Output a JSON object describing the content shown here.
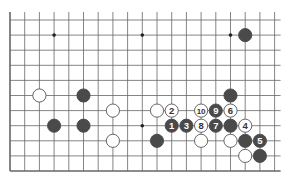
{
  "diagram": {
    "grid": {
      "origin_x": 10,
      "origin_y": 20,
      "spacing_x": 14.7,
      "spacing_y": 15.1,
      "cols": 19,
      "rows": 11,
      "left_edge": true,
      "bottom_edge": true,
      "top_edge": false,
      "right_edge": false
    },
    "colors": {
      "line": "#666666",
      "black": "#4a4a4a",
      "white": "#ffffff",
      "label_on_black": "#ffffff",
      "label_on_white": "#333333"
    },
    "star_points": [
      [
        3,
        1
      ],
      [
        9,
        1
      ],
      [
        15,
        1
      ],
      [
        9,
        7
      ]
    ],
    "stones": [
      {
        "col": 16,
        "row": 1,
        "color": "black",
        "label": ""
      },
      {
        "col": 2,
        "row": 5,
        "color": "white",
        "label": ""
      },
      {
        "col": 5,
        "row": 5,
        "color": "black",
        "label": ""
      },
      {
        "col": 15,
        "row": 5,
        "color": "black",
        "label": ""
      },
      {
        "col": 7,
        "row": 6,
        "color": "white",
        "label": ""
      },
      {
        "col": 10,
        "row": 6,
        "color": "white",
        "label": ""
      },
      {
        "col": 11,
        "row": 6,
        "color": "white",
        "label": "2"
      },
      {
        "col": 13,
        "row": 6,
        "color": "white",
        "label": "10"
      },
      {
        "col": 14,
        "row": 6,
        "color": "black",
        "label": "9"
      },
      {
        "col": 15,
        "row": 6,
        "color": "white",
        "label": "6"
      },
      {
        "col": 3,
        "row": 7,
        "color": "black",
        "label": ""
      },
      {
        "col": 5,
        "row": 7,
        "color": "black",
        "label": ""
      },
      {
        "col": 11,
        "row": 7,
        "color": "black",
        "label": "1"
      },
      {
        "col": 12,
        "row": 7,
        "color": "black",
        "label": "3"
      },
      {
        "col": 13,
        "row": 7,
        "color": "white",
        "label": "8"
      },
      {
        "col": 14,
        "row": 7,
        "color": "black",
        "label": "7"
      },
      {
        "col": 15,
        "row": 7,
        "color": "black",
        "label": ""
      },
      {
        "col": 16,
        "row": 7,
        "color": "white",
        "label": "4"
      },
      {
        "col": 7,
        "row": 8,
        "color": "white",
        "label": ""
      },
      {
        "col": 10,
        "row": 8,
        "color": "black",
        "label": ""
      },
      {
        "col": 13,
        "row": 8,
        "color": "white",
        "label": ""
      },
      {
        "col": 15,
        "row": 8,
        "color": "white",
        "label": ""
      },
      {
        "col": 16,
        "row": 8,
        "color": "black",
        "label": ""
      },
      {
        "col": 17,
        "row": 8,
        "color": "black",
        "label": "5"
      },
      {
        "col": 16,
        "row": 9,
        "color": "white",
        "label": ""
      },
      {
        "col": 17,
        "row": 9,
        "color": "black",
        "label": ""
      }
    ]
  }
}
